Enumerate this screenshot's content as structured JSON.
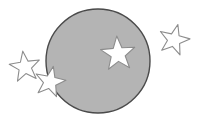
{
  "canvas": {
    "width": 197,
    "height": 128,
    "background_color": "#ffffff",
    "border_color": "#c8c8c8"
  },
  "shapes": {
    "circle": {
      "name": "gray-disc",
      "cx": 98,
      "cy": 61,
      "r": 52,
      "fill": "#b4b4b4",
      "stroke": "#4a4a4a",
      "stroke_width": 1.4
    },
    "stars": [
      {
        "name": "star-on-disc",
        "label": "large star inside disc",
        "cx": 118,
        "cy": 54,
        "outer_r": 18,
        "inner_r": 7.4,
        "rotation": -4,
        "fill": "#ffffff",
        "stroke": "#8c8c8c",
        "stroke_width": 1.1,
        "on_disc": true
      },
      {
        "name": "star-overlapping-edge",
        "label": "star straddling left edge of disc",
        "cx": 50,
        "cy": 82,
        "outer_r": 16,
        "inner_r": 6.6,
        "rotation": 12,
        "fill": "#ffffff",
        "stroke": "#8c8c8c",
        "stroke_width": 1.1,
        "on_disc": false
      },
      {
        "name": "star-left-outside",
        "label": "star left of disc",
        "cx": 25,
        "cy": 67,
        "outer_r": 16,
        "inner_r": 6.6,
        "rotation": -8,
        "fill": "#ffffff",
        "stroke": "#8c8c8c",
        "stroke_width": 1.1,
        "on_disc": false
      },
      {
        "name": "star-upper-right-outside",
        "label": "star upper right of disc",
        "cx": 174,
        "cy": 40,
        "outer_r": 16,
        "inner_r": 6.6,
        "rotation": 14,
        "fill": "#ffffff",
        "stroke": "#8c8c8c",
        "stroke_width": 1.1,
        "on_disc": false
      }
    ]
  },
  "counts": {
    "circles": 1,
    "stars": 4,
    "stars_touching_circle": 2
  }
}
